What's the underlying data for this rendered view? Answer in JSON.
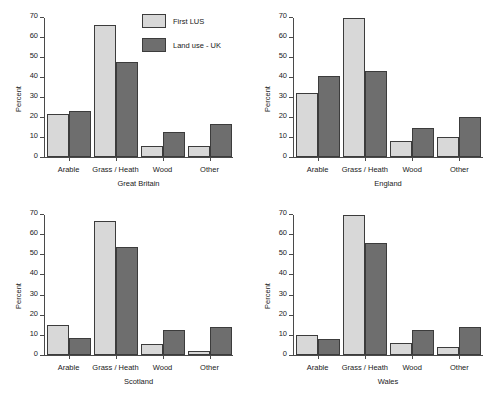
{
  "chart_data": {
    "type": "bar",
    "title": "",
    "xlabel": "",
    "ylabel": "Percent",
    "ylim": [
      0,
      70
    ],
    "yticks": [
      0,
      10,
      20,
      30,
      40,
      50,
      60,
      70
    ],
    "grid": false,
    "legend_position": "top-center",
    "categories": [
      "Arable",
      "Grass / Heath",
      "Wood",
      "Other"
    ],
    "legend": [
      {
        "name": "First LUS",
        "color": "#d8d8d8"
      },
      {
        "name": "Land use - UK",
        "color": "#6e6e6e"
      }
    ],
    "panels": [
      {
        "title": "Great Britain",
        "series": [
          {
            "name": "First LUS",
            "values": [
              21.8,
              66.7,
              5.3,
              5.6
            ]
          },
          {
            "name": "Land use - UK",
            "values": [
              23.3,
              48.0,
              12.8,
              16.6
            ]
          }
        ]
      },
      {
        "title": "England",
        "series": [
          {
            "name": "First LUS",
            "values": [
              32.0,
              70.0,
              8.0,
              10.3
            ]
          },
          {
            "name": "Land use - UK",
            "values": [
              41.0,
              43.5,
              14.5,
              20.0
            ]
          }
        ]
      },
      {
        "title": "Scotland",
        "series": [
          {
            "name": "First LUS",
            "values": [
              15.2,
              66.8,
              5.3,
              2.0
            ]
          },
          {
            "name": "Land use - UK",
            "values": [
              8.7,
              54.2,
              12.7,
              14.2
            ]
          }
        ]
      },
      {
        "title": "Wales",
        "series": [
          {
            "name": "First LUS",
            "values": [
              10.2,
              70.0,
              6.0,
              4.0
            ]
          },
          {
            "name": "Land use - UK",
            "values": [
              8.0,
              56.0,
              12.3,
              14.0
            ]
          }
        ]
      }
    ]
  }
}
